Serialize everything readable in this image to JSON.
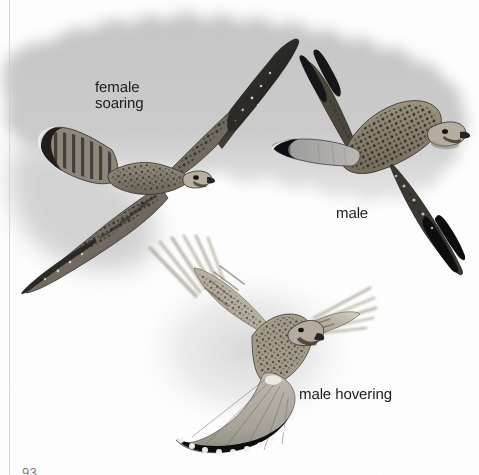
{
  "plate": {
    "title": "Common Kestrel flight illustrations",
    "width": 479,
    "height": 475,
    "background_color": "#ffffff",
    "sky_color": "#c9c9c9",
    "ink_color": "#1b1b1b"
  },
  "labels": {
    "female_soaring": "female\nsoaring",
    "female_soaring_line1": "female",
    "female_soaring_line2": "soaring",
    "male": "male",
    "male_hovering": "male hovering"
  },
  "folio": {
    "page_number": "93"
  },
  "figures": [
    {
      "id": "female-soaring",
      "label": "female soaring",
      "pose": "soaring, seen from above",
      "sex": "female",
      "plumage_notes": "barred brown upperparts, heavily spotted, barred tail with broad dark subterminal band and pale tip, dark wingtips"
    },
    {
      "id": "male",
      "label": "male",
      "pose": "gliding, seen from above",
      "sex": "male",
      "plumage_notes": "spotted chestnut back, blue-grey tail with black terminal band and white tip, blackish primaries"
    },
    {
      "id": "male-hovering",
      "label": "male hovering",
      "pose": "hovering, tail fanned",
      "sex": "male",
      "plumage_notes": "wings raised and beating, tail spread showing black terminal band and white trailing edge"
    }
  ],
  "icons": {
    "sky_cloud": "cloud-shape-icon",
    "bird_female": "bird-soaring-icon",
    "bird_male": "bird-gliding-icon",
    "bird_hovering": "bird-hovering-icon"
  }
}
